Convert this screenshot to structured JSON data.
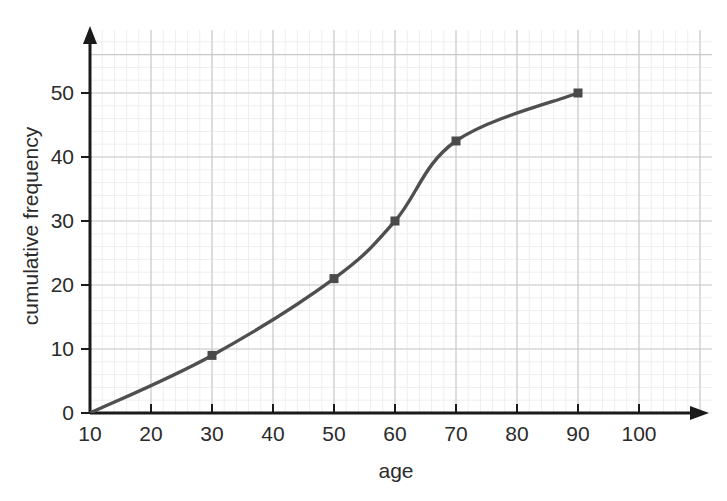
{
  "chart_data": {
    "type": "line",
    "title": "",
    "xlabel": "age",
    "ylabel": "cumulative frequency",
    "xlim": [
      10,
      105
    ],
    "ylim": [
      0,
      56
    ],
    "xticks": [
      10,
      20,
      30,
      40,
      50,
      60,
      70,
      80,
      90,
      100
    ],
    "yticks": [
      0,
      10,
      20,
      30,
      40,
      50
    ],
    "xtick_labels": [
      "10",
      "20",
      "30",
      "40",
      "50",
      "60",
      "70",
      "80",
      "90",
      "100"
    ],
    "ytick_labels": [
      "0",
      "10",
      "20",
      "30",
      "40",
      "50"
    ],
    "grid": true,
    "minor_grid": true,
    "legend": "none",
    "x": [
      10,
      30,
      50,
      60,
      70,
      90
    ],
    "values": [
      0,
      9,
      21,
      30,
      42.5,
      50
    ],
    "points": [
      {
        "x": 10,
        "y": 0,
        "marker": false
      },
      {
        "x": 30,
        "y": 9,
        "marker": true
      },
      {
        "x": 50,
        "y": 21,
        "marker": true
      },
      {
        "x": 60,
        "y": 30,
        "marker": true
      },
      {
        "x": 70,
        "y": 42.5,
        "marker": true
      },
      {
        "x": 90,
        "y": 50,
        "marker": true
      }
    ],
    "series": [
      {
        "name": "cumulative frequency",
        "values": [
          0,
          9,
          21,
          30,
          42.5,
          50
        ]
      }
    ],
    "line_color": "#4f4f4f",
    "marker_color": "#4a4a4a",
    "marker_shape": "square",
    "axis_color": "#1a1a1a",
    "grid_color": "#c9c9c9",
    "minor_grid_color": "#eeeeee",
    "background_color": "#ffffff"
  },
  "axes": {
    "x_title": "age",
    "y_title": "cumulative frequency"
  }
}
